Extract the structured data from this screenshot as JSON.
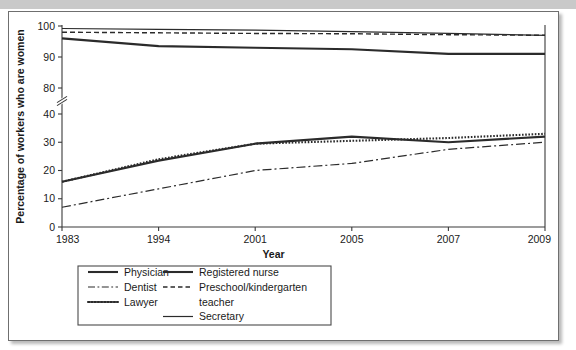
{
  "figure": {
    "name": "women-in-occupations-line-chart",
    "frame_border_color": "#6f6f6f",
    "top_band_color": "#c9c9c9",
    "line_color": "#2b2b2b"
  },
  "chart_data": {
    "type": "line",
    "title": "",
    "xlabel": "Year",
    "ylabel": "Percentage of workers who are women",
    "categories": [
      "1983",
      "1994",
      "2001",
      "2005",
      "2007",
      "2009"
    ],
    "x": [
      1983,
      1994,
      2001,
      2005,
      2007,
      2009
    ],
    "x_scale": "categorical-evenly-spaced",
    "ylim": [
      0,
      100
    ],
    "y_ticks": [
      0,
      10,
      20,
      30,
      40,
      80,
      90,
      100
    ],
    "y_axis_break": {
      "present": true,
      "between": [
        40,
        80
      ],
      "symbol": "double-slash"
    },
    "grid": false,
    "legend_position": "below-plot-left",
    "legend_columns": 2,
    "series": [
      {
        "name": "Physician",
        "line_style": "solid-thick",
        "dasharray": "none",
        "stroke_width": 2.1,
        "values": [
          16,
          23.5,
          29.5,
          32,
          30,
          32
        ]
      },
      {
        "name": "Dentist",
        "line_style": "dash-dot",
        "dasharray": "9,3,2,3",
        "stroke_width": 1.2,
        "values": [
          7,
          13.5,
          20,
          22.5,
          27.5,
          30
        ]
      },
      {
        "name": "Lawyer",
        "line_style": "dotted",
        "dasharray": "1.6,1.6",
        "stroke_width": 2.1,
        "values": [
          16,
          24,
          29.5,
          30.5,
          31.5,
          33
        ]
      },
      {
        "name": "Registered nurse",
        "line_style": "solid-thick",
        "dasharray": "none",
        "stroke_width": 2.1,
        "values": [
          96,
          93.5,
          93,
          92.5,
          91,
          91
        ]
      },
      {
        "name": "Preschool/kindergarten teacher",
        "line_style": "dashed",
        "dasharray": "5,3",
        "stroke_width": 1.4,
        "values": [
          98,
          97.8,
          97.6,
          97.5,
          97.2,
          97
        ]
      },
      {
        "name": "Secretary",
        "line_style": "solid-thin",
        "dasharray": "none",
        "stroke_width": 1.2,
        "values": [
          99.2,
          98.9,
          98.7,
          98.2,
          97.6,
          97
        ]
      }
    ]
  },
  "axes": {
    "y_tick_labels": [
      "100",
      "90",
      "80",
      "40",
      "30",
      "20",
      "10",
      "0"
    ],
    "x_tick_labels": [
      "1983",
      "1994",
      "2001",
      "2005",
      "2007",
      "2009"
    ],
    "x_title": "Year",
    "y_title": "Percentage of workers who are women"
  },
  "legend": {
    "entries": [
      {
        "label": "Physician",
        "style": "solid-thick"
      },
      {
        "label": "Registered nurse",
        "style": "solid-thick"
      },
      {
        "label": "Dentist",
        "style": "dash-dot"
      },
      {
        "label": "Preschool/kindergarten",
        "style": "dashed"
      },
      {
        "label": "teacher",
        "style": "continuation"
      },
      {
        "label": "Lawyer",
        "style": "dotted"
      },
      {
        "label": "Secretary",
        "style": "solid-thin"
      }
    ]
  }
}
